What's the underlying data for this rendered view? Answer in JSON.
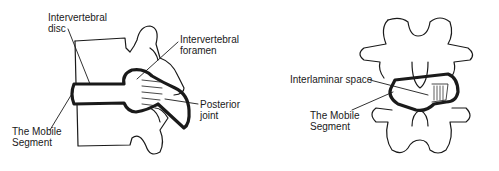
{
  "diagram": {
    "left_panel": {
      "view": "lateral",
      "labels": {
        "disc": "Intervertebral\ndisc",
        "foramen": "Intervertebral\nforamen",
        "joint": "Posterior\njoint",
        "segment": "The Mobile\nSegment"
      }
    },
    "right_panel": {
      "view": "posterior",
      "labels": {
        "interlaminar": "Interlaminar space",
        "segment": "The Mobile\nSegment"
      }
    },
    "colors": {
      "ink": "#1a1a1a",
      "background": "#ffffff"
    }
  }
}
